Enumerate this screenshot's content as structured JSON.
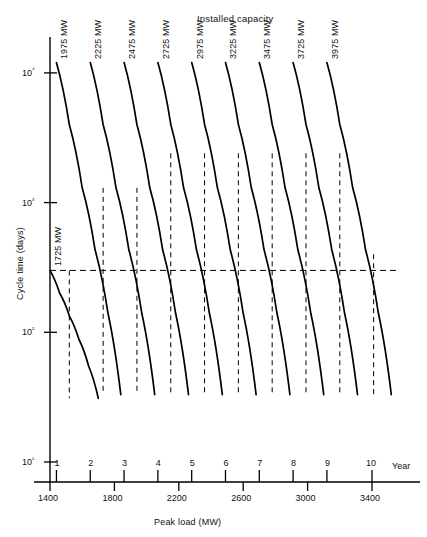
{
  "figure": {
    "title": "Installed capacity",
    "y_axis_title": "Cycle time (days)",
    "x_axis_title": "Peak load (MW)",
    "year_axis_label": "Year"
  },
  "chart_data": {
    "type": "line",
    "title": "Installed capacity",
    "xlabel": "Peak load (MW)",
    "ylabel": "Cycle time (days)",
    "yscale": "log",
    "xscale": "linear",
    "xlim": [
      1400,
      3560
    ],
    "ylim": [
      10,
      20000
    ],
    "grid": false,
    "legend_position": "inline-curve-labels",
    "x_ticks": [
      1400,
      1800,
      2200,
      2600,
      3000,
      3400
    ],
    "x_tick_labels": [
      "1400",
      "1800",
      "2200",
      "2600",
      "3000",
      "3400"
    ],
    "y_ticks": [
      10,
      100,
      1000,
      10000
    ],
    "y_tick_labels": [
      "10¹",
      "10²",
      "10³",
      "10⁴"
    ],
    "secondary_x_axis": {
      "name": "Year",
      "ticks": [
        1,
        2,
        3,
        4,
        5,
        6,
        7,
        8,
        9,
        10
      ],
      "tick_labels": [
        "1",
        "2",
        "3",
        "4",
        "5",
        "6",
        "7",
        "8",
        "9",
        "10"
      ],
      "tick_peak_load": [
        1440,
        1650,
        1860,
        2070,
        2280,
        2490,
        2700,
        2910,
        3120,
        3400
      ]
    },
    "annotations": {
      "horizontal_reference_line": {
        "y_value": 300,
        "style": "dashed",
        "x_from": 1400,
        "x_to": 3560
      }
    },
    "series": [
      {
        "name": "1725 MW",
        "label": "1725 MW",
        "x": [
          1400,
          1460,
          1520,
          1580,
          1640,
          1700
        ],
        "y": [
          300,
          200,
          134,
          88,
          55,
          31
        ]
      },
      {
        "name": "1975 MW",
        "label": "1975 MW",
        "x": [
          1440,
          1520,
          1600,
          1680,
          1760,
          1840
        ],
        "y": [
          12000,
          4000,
          1300,
          430,
          140,
          33
        ]
      },
      {
        "name": "2225 MW",
        "label": "2225 MW",
        "x": [
          1650,
          1730,
          1810,
          1890,
          1970,
          2050
        ],
        "y": [
          12000,
          4000,
          1300,
          430,
          140,
          33
        ]
      },
      {
        "name": "2475 MW",
        "label": "2475 MW",
        "x": [
          1860,
          1940,
          2020,
          2100,
          2180,
          2260
        ],
        "y": [
          12000,
          4000,
          1300,
          430,
          140,
          33
        ]
      },
      {
        "name": "2725 MW",
        "label": "2725 MW",
        "x": [
          2070,
          2150,
          2230,
          2310,
          2390,
          2470
        ],
        "y": [
          12000,
          4000,
          1300,
          430,
          140,
          33
        ]
      },
      {
        "name": "2975 MW",
        "label": "2975 MW",
        "x": [
          2280,
          2360,
          2440,
          2520,
          2600,
          2680
        ],
        "y": [
          12000,
          4000,
          1300,
          430,
          140,
          33
        ]
      },
      {
        "name": "3225 MW",
        "label": "3225 MW",
        "x": [
          2490,
          2570,
          2650,
          2730,
          2810,
          2890
        ],
        "y": [
          12000,
          4000,
          1300,
          430,
          140,
          33
        ]
      },
      {
        "name": "3475 MW",
        "label": "3475 MW",
        "x": [
          2700,
          2780,
          2860,
          2940,
          3020,
          3100
        ],
        "y": [
          12000,
          4000,
          1300,
          430,
          140,
          33
        ]
      },
      {
        "name": "3725 MW",
        "label": "3725 MW",
        "x": [
          2910,
          2990,
          3070,
          3150,
          3230,
          3310
        ],
        "y": [
          12000,
          4000,
          1300,
          430,
          140,
          33
        ]
      },
      {
        "name": "3975 MW",
        "label": "3975 MW",
        "x": [
          3120,
          3200,
          3280,
          3360,
          3440,
          3520
        ],
        "y": [
          12000,
          4000,
          1300,
          430,
          140,
          33
        ]
      }
    ],
    "step_connectors": [
      {
        "x": 1520,
        "y_from": 300,
        "y_to": 31
      },
      {
        "x": 1730,
        "y_from": 1300,
        "y_to": 33
      },
      {
        "x": 1940,
        "y_from": 1300,
        "y_to": 33
      },
      {
        "x": 2150,
        "y_from": 2400,
        "y_to": 33
      },
      {
        "x": 2360,
        "y_from": 2400,
        "y_to": 33
      },
      {
        "x": 2570,
        "y_from": 2400,
        "y_to": 33
      },
      {
        "x": 2780,
        "y_from": 2400,
        "y_to": 33
      },
      {
        "x": 2990,
        "y_from": 2400,
        "y_to": 33
      },
      {
        "x": 3200,
        "y_from": 2400,
        "y_to": 33
      },
      {
        "x": 3410,
        "y_from": 400,
        "y_to": 33
      }
    ]
  }
}
